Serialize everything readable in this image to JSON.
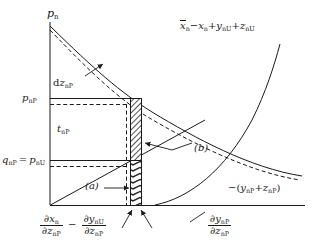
{
  "figure": {
    "type": "diagram",
    "axes": {
      "y_axis_label": "p",
      "y_axis_label_sub": "n",
      "baseline_present": true
    },
    "labels": {
      "y_axis": {
        "main": "p",
        "sub": "n"
      },
      "upper_right_curve": {
        "overline_var": "x",
        "overline_sub": "n",
        "text": "x̄n − xn + ynU + znU",
        "parts": [
          {
            "v": "x",
            "sub": "n",
            "over": true
          },
          {
            "op": "−"
          },
          {
            "v": "x",
            "sub": "n"
          },
          {
            "op": "+"
          },
          {
            "v": "y",
            "sub": "nU"
          },
          {
            "op": "+"
          },
          {
            "v": "z",
            "sub": "nU"
          }
        ]
      },
      "lower_right_curve": {
        "text": "−(ynP + znP)",
        "parts": [
          {
            "op": "−("
          },
          {
            "v": "y",
            "sub": "nP"
          },
          {
            "op": "+"
          },
          {
            "v": "z",
            "sub": "nP"
          },
          {
            "op": ")"
          }
        ]
      },
      "dz_label": {
        "d": "d",
        "v": "z",
        "sub": "nP",
        "text": "dznP"
      },
      "p_nP": {
        "v": "p",
        "sub": "nP",
        "text": "pnP"
      },
      "q_nP_eq_p_nU": {
        "text": "qnP = pnU",
        "left": {
          "v": "q",
          "sub": "nP"
        },
        "eq": "=",
        "right": {
          "v": "p",
          "sub": "nU"
        }
      },
      "t_nP": {
        "v": "t",
        "sub": "nP",
        "text": "tnP"
      },
      "callout_a": "(a)",
      "callout_b": "(b)",
      "bottom_left_expression": {
        "text": "∂xn/∂znP − ∂ynU/∂znP",
        "frac1": {
          "num": {
            "d": "∂",
            "v": "x",
            "sub": "n"
          },
          "den": {
            "d": "∂",
            "v": "z",
            "sub": "nP"
          }
        },
        "minus": "−",
        "frac2": {
          "num": {
            "d": "∂",
            "v": "y",
            "sub": "nU"
          },
          "den": {
            "d": "∂",
            "v": "z",
            "sub": "nP"
          }
        }
      },
      "bottom_right_expression": {
        "text": "∂ynP/∂znP",
        "frac": {
          "num": {
            "d": "∂",
            "v": "y",
            "sub": "nP"
          },
          "den": {
            "d": "∂",
            "v": "z",
            "sub": "nP"
          }
        }
      }
    },
    "colors": {
      "line": "#1a1a1a",
      "background": "#ffffff",
      "hatch": "#2a2a2a"
    }
  }
}
